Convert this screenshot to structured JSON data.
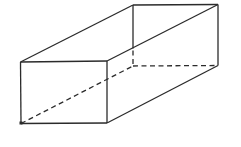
{
  "figure": {
    "type": "wireframe-box-diagram",
    "background_color": "#ffffff",
    "stroke_color": "#2b2b2b",
    "stroke_width": 1.3,
    "dash_pattern": "5,3.5",
    "width": 241,
    "height": 147,
    "vertices": {
      "front_top_left": [
        20.5,
        62
      ],
      "front_top_right": [
        107,
        61
      ],
      "front_bottom_right": [
        107,
        123
      ],
      "front_bottom_left": [
        21,
        123.5
      ],
      "back_top_left": [
        133,
        5
      ],
      "back_top_right": [
        218,
        4.5
      ],
      "back_bottom_right": [
        218,
        65.5
      ],
      "back_bottom_left": [
        133,
        66
      ]
    },
    "edges": [
      {
        "name": "front-top-edge",
        "from": "front_top_left",
        "to": "front_top_right",
        "style": "solid"
      },
      {
        "name": "front-right-edge",
        "from": "front_top_right",
        "to": "front_bottom_right",
        "style": "solid"
      },
      {
        "name": "front-bottom-edge",
        "from": "front_bottom_left",
        "to": "front_bottom_right",
        "style": "solid"
      },
      {
        "name": "front-left-edge",
        "from": "front_top_left",
        "to": "front_bottom_left",
        "style": "solid"
      },
      {
        "name": "top-left-slant-edge",
        "from": "front_top_left",
        "to": "back_top_left",
        "style": "solid"
      },
      {
        "name": "top-right-slant-edge",
        "from": "front_top_right",
        "to": "back_top_right",
        "style": "solid"
      },
      {
        "name": "back-top-edge",
        "from": "back_top_left",
        "to": "back_top_right",
        "style": "solid"
      },
      {
        "name": "back-right-edge",
        "from": "back_top_right",
        "to": "back_bottom_right",
        "style": "solid"
      },
      {
        "name": "bottom-right-slant-edge",
        "from": "front_bottom_right",
        "to": "back_bottom_right",
        "style": "solid"
      },
      {
        "name": "back-left-edge-visible",
        "p1": [
          133,
          5
        ],
        "p2": [
          133,
          48.5
        ],
        "style": "solid"
      },
      {
        "name": "back-left-edge-hidden",
        "p1": [
          133,
          50.5
        ],
        "p2": [
          133,
          66
        ],
        "style": "dashed"
      },
      {
        "name": "bottom-back-edge-hidden",
        "from": "back_bottom_left",
        "to": "back_bottom_right",
        "style": "dashed"
      },
      {
        "name": "bottom-left-slant-hidden",
        "from": "front_bottom_left",
        "to": "back_bottom_left",
        "style": "dashed"
      }
    ],
    "corner_dot": {
      "name": "front-bottom-left-corner-dot",
      "center": [
        21,
        123
      ],
      "size": 3
    }
  }
}
